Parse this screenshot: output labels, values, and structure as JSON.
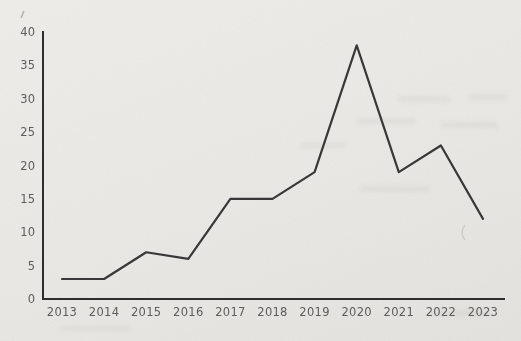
{
  "page": {
    "kind": "scanned-book-page-line-chart",
    "background_color": "#ebeae6"
  },
  "chart_data": {
    "type": "line",
    "title": "",
    "xlabel": "",
    "ylabel": "",
    "categories": [
      "2013",
      "2014",
      "2015",
      "2016",
      "2017",
      "2018",
      "2019",
      "2020",
      "2021",
      "2022",
      "2023"
    ],
    "values": [
      3,
      3,
      7,
      6,
      15,
      15,
      19,
      38,
      19,
      23,
      12
    ],
    "ylim": [
      0,
      40
    ],
    "ytick_step": 5,
    "ytick_labels": [
      "0",
      "5",
      "10",
      "15",
      "20",
      "25",
      "30",
      "35",
      "40"
    ],
    "grid": false,
    "legend": false,
    "line_color": "#383838",
    "axis_color": "#2e2e2e",
    "tick_label_color": "#5c5c5c"
  }
}
